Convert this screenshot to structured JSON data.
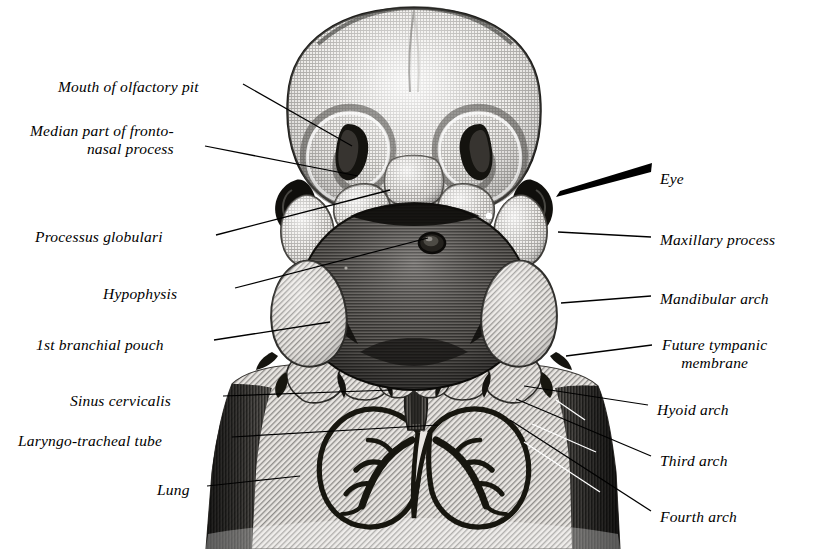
{
  "figure": {
    "kind": "anatomical-engraving",
    "style": "monochrome stipple / line engraving",
    "background_color": "#ffffff",
    "ink_color": "#000000"
  },
  "labels_left": [
    {
      "id": "mouth-of-olfactory-pit",
      "text": "Mouth of olfactory pit",
      "x": 58,
      "y": 78,
      "lines": 1
    },
    {
      "id": "median-part-of-fronto-nasal-process",
      "text": "Median part of fronto-\nnasal process",
      "x": 30,
      "y": 122,
      "lines": 2
    },
    {
      "id": "processus-globulari",
      "text": "Processus globulari",
      "x": 35,
      "y": 228,
      "lines": 1
    },
    {
      "id": "hypophysis",
      "text": "Hypophysis",
      "x": 103,
      "y": 285,
      "lines": 1
    },
    {
      "id": "1st-branchial-pouch",
      "text": "1st branchial pouch",
      "x": 36,
      "y": 336,
      "lines": 1
    },
    {
      "id": "sinus-cervicalis",
      "text": "Sinus cervicalis",
      "x": 70,
      "y": 392,
      "lines": 1
    },
    {
      "id": "laryngo-tracheal-tube",
      "text": "Laryngo-tracheal tube",
      "x": 18,
      "y": 432,
      "lines": 1
    },
    {
      "id": "lung",
      "text": "Lung",
      "x": 157,
      "y": 481,
      "lines": 1
    }
  ],
  "labels_right": [
    {
      "id": "eye",
      "text": "Eye",
      "x": 660,
      "y": 170,
      "lines": 1
    },
    {
      "id": "maxillary-process",
      "text": "Maxillary process",
      "x": 660,
      "y": 231,
      "lines": 1
    },
    {
      "id": "mandibular-arch",
      "text": "Mandibular arch",
      "x": 660,
      "y": 290,
      "lines": 1
    },
    {
      "id": "future-tympanic-membrane",
      "text": "Future tympanic\nmembrane",
      "x": 662,
      "y": 336,
      "lines": 2
    },
    {
      "id": "hyoid-arch",
      "text": "Hyoid arch",
      "x": 657,
      "y": 401,
      "lines": 1
    },
    {
      "id": "third-arch",
      "text": "Third arch",
      "x": 660,
      "y": 452,
      "lines": 1
    },
    {
      "id": "fourth-arch",
      "text": "Fourth arch",
      "x": 660,
      "y": 508,
      "lines": 1
    }
  ],
  "leaders": [
    {
      "id": "leader-mouth-of-olfactory-pit",
      "from": [
        243,
        84
      ],
      "to": [
        352,
        146
      ],
      "taper": "thin"
    },
    {
      "id": "leader-median-part-of-fronto-nasal-process",
      "from": [
        205,
        146
      ],
      "to": [
        358,
        176
      ],
      "taper": "thin"
    },
    {
      "id": "leader-processus-globulari",
      "from": [
        216,
        235
      ],
      "to": [
        390,
        190
      ],
      "taper": "thin"
    },
    {
      "id": "leader-hypophysis",
      "from": [
        235,
        288
      ],
      "to": [
        428,
        238
      ],
      "taper": "thin"
    },
    {
      "id": "leader-1st-branchial-pouch",
      "from": [
        214,
        340
      ],
      "to": [
        330,
        322
      ],
      "taper": "thin"
    },
    {
      "id": "leader-sinus-cervicalis",
      "from": [
        223,
        396
      ],
      "to": [
        392,
        390
      ],
      "taper": "thin"
    },
    {
      "id": "leader-laryngo-tracheal-tube",
      "from": [
        232,
        437
      ],
      "to": [
        438,
        425
      ],
      "taper": "thin"
    },
    {
      "id": "leader-lung",
      "from": [
        207,
        486
      ],
      "to": [
        300,
        476
      ],
      "taper": "thin"
    },
    {
      "id": "leader-eye",
      "from": [
        651,
        168
      ],
      "to": [
        556,
        195
      ],
      "taper": "wedge"
    },
    {
      "id": "leader-maxillary-process",
      "from": [
        651,
        237
      ],
      "to": [
        558,
        232
      ],
      "taper": "thin"
    },
    {
      "id": "leader-mandibular-arch",
      "from": [
        651,
        296
      ],
      "to": [
        561,
        303
      ],
      "taper": "thin"
    },
    {
      "id": "leader-future-tympanic-membrane",
      "from": [
        652,
        345
      ],
      "to": [
        566,
        356
      ],
      "taper": "thin"
    },
    {
      "id": "leader-hyoid-arch",
      "from": [
        648,
        405
      ],
      "to": [
        524,
        386
      ],
      "taper": "thin"
    },
    {
      "id": "leader-third-arch",
      "from": [
        651,
        456
      ],
      "to": [
        516,
        399
      ],
      "taper": "thin"
    },
    {
      "id": "leader-fourth-arch",
      "from": [
        651,
        511
      ],
      "to": [
        510,
        420
      ],
      "taper": "thin"
    }
  ],
  "anatomy_parts": [
    {
      "id": "forebrain-prominence",
      "name": "Forebrain / frontal prominence",
      "tone": "light stipple"
    },
    {
      "id": "olfactory-pit-left",
      "name": "Left olfactory pit",
      "tone": "dark"
    },
    {
      "id": "olfactory-pit-right",
      "name": "Right olfactory pit",
      "tone": "dark"
    },
    {
      "id": "globular-process-left",
      "name": "Left processus globularis",
      "tone": "light"
    },
    {
      "id": "globular-process-right",
      "name": "Right processus globularis",
      "tone": "light"
    },
    {
      "id": "eye-left",
      "name": "Left eye",
      "tone": "black"
    },
    {
      "id": "eye-right",
      "name": "Right eye",
      "tone": "black"
    },
    {
      "id": "maxillary-process-left",
      "name": "Left maxillary process",
      "tone": "light"
    },
    {
      "id": "maxillary-process-right",
      "name": "Right maxillary process",
      "tone": "light"
    },
    {
      "id": "mandibular-arch-left",
      "name": "Left mandibular arch",
      "tone": "hatched"
    },
    {
      "id": "mandibular-arch-right",
      "name": "Right mandibular arch",
      "tone": "hatched"
    },
    {
      "id": "pharyngeal-cavity",
      "name": "Pharyngeal / oral cavity",
      "tone": "dark hatch"
    },
    {
      "id": "hypophysis-pit",
      "name": "Hypophysial recess (Rathke's pouch)",
      "tone": "dark ring"
    },
    {
      "id": "hyoid-arch-left",
      "name": "Left hyoid arch",
      "tone": "hatched"
    },
    {
      "id": "hyoid-arch-right",
      "name": "Right hyoid arch",
      "tone": "hatched"
    },
    {
      "id": "third-arch-left",
      "name": "Left third arch",
      "tone": "hatched"
    },
    {
      "id": "third-arch-right",
      "name": "Right third arch",
      "tone": "hatched"
    },
    {
      "id": "fourth-arch-left",
      "name": "Left fourth arch",
      "tone": "hatched"
    },
    {
      "id": "fourth-arch-right",
      "name": "Right fourth arch",
      "tone": "hatched"
    },
    {
      "id": "thorax-body-wall",
      "name": "Thoracic body wall",
      "tone": "diagonal hatch"
    },
    {
      "id": "lung-left",
      "name": "Left lung with bronchial tree",
      "tone": "outlined"
    },
    {
      "id": "lung-right",
      "name": "Right lung with bronchial tree",
      "tone": "outlined"
    },
    {
      "id": "laryngo-tracheal-tube-part",
      "name": "Laryngo-tracheal tube",
      "tone": "dark midline"
    }
  ]
}
